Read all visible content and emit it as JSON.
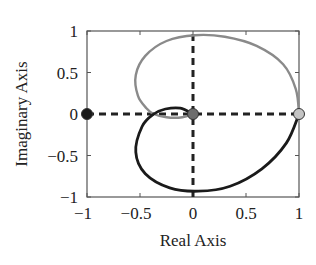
{
  "chart_data": {
    "type": "line",
    "title": "",
    "xlabel": "Real Axis",
    "ylabel": "Imaginary Axis",
    "xlim": [
      -1,
      1
    ],
    "ylim": [
      -1,
      1
    ],
    "grid": false,
    "legend": null,
    "x_ticks": [
      "-1",
      "-0.5",
      "0",
      "0.5",
      "1"
    ],
    "y_ticks": [
      "1",
      "0.5",
      "0",
      "-0.5",
      "-1"
    ],
    "x_tick_values": [
      -1,
      -0.5,
      0,
      0.5,
      1
    ],
    "y_tick_values": [
      1,
      0.5,
      0,
      -0.5,
      -1
    ],
    "series": [
      {
        "name": "upper-locus",
        "color": "#8a8a8a",
        "style": "solid",
        "points": [
          [
            1.0,
            0.0
          ],
          [
            0.97,
            0.3
          ],
          [
            0.85,
            0.6
          ],
          [
            0.6,
            0.82
          ],
          [
            0.3,
            0.93
          ],
          [
            0.02,
            0.95
          ],
          [
            -0.25,
            0.88
          ],
          [
            -0.45,
            0.7
          ],
          [
            -0.54,
            0.47
          ],
          [
            -0.52,
            0.22
          ],
          [
            -0.44,
            0.07
          ],
          [
            -0.37,
            0.0
          ],
          [
            -0.25,
            -0.04
          ],
          [
            -0.1,
            -0.04
          ],
          [
            0.0,
            0.0
          ]
        ]
      },
      {
        "name": "lower-locus",
        "color": "#1a1a1a",
        "style": "solid",
        "points": [
          [
            0.0,
            0.0
          ],
          [
            -0.12,
            0.07
          ],
          [
            -0.26,
            0.06
          ],
          [
            -0.37,
            0.0
          ],
          [
            -0.48,
            -0.15
          ],
          [
            -0.54,
            -0.46
          ],
          [
            -0.45,
            -0.72
          ],
          [
            -0.22,
            -0.89
          ],
          [
            0.05,
            -0.93
          ],
          [
            0.35,
            -0.87
          ],
          [
            0.65,
            -0.66
          ],
          [
            0.88,
            -0.35
          ],
          [
            1.0,
            0.0
          ]
        ]
      },
      {
        "name": "real-axis-dashed",
        "color": "#222222",
        "style": "dashed",
        "points": [
          [
            -1,
            0
          ],
          [
            1,
            0
          ]
        ]
      },
      {
        "name": "imag-axis-dashed",
        "color": "#222222",
        "style": "dashed",
        "points": [
          [
            0,
            -1
          ],
          [
            0,
            1
          ]
        ]
      }
    ],
    "markers": [
      {
        "name": "critical-point",
        "x": -1,
        "y": 0,
        "fill": "#1a1a1a"
      },
      {
        "name": "origin-point",
        "x": 0,
        "y": 0,
        "fill": "#6e6e6e"
      },
      {
        "name": "unit-point",
        "x": 1,
        "y": 0,
        "fill": "#c4c4c4"
      }
    ]
  }
}
